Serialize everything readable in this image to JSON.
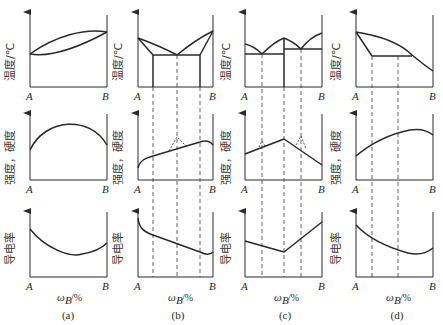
{
  "figure": {
    "colors": {
      "line": "#2a2a2a",
      "background": "#ffffff"
    },
    "row_labels": {
      "temperature": "温度/℃",
      "strength_hardness": "强度，硬度",
      "conductivity": "导电率"
    },
    "axis_labels": {
      "left": "A",
      "right": "B",
      "x_label_main": "ω",
      "x_label_sub": "B",
      "x_label_unit": "/%"
    },
    "panels": [
      {
        "id": "a",
        "caption": "(a)",
        "type": "isomorphous (complete solid solubility)",
        "temperature": "lens-shaped liquidus/solidus from A to B",
        "strength_hardness": "convex arch with maximum near middle",
        "conductivity": "concave curve with minimum near middle-right"
      },
      {
        "id": "b",
        "caption": "(b)",
        "type": "eutectic with limited solid solubility",
        "temperature": "V-shaped liquidus meeting at eutectic point, horizontal eutectic line, solvus lines",
        "strength_hardness": "rising curve with linear middle section and dashed peak at eutectic",
        "conductivity": "descending curve with linear middle section"
      },
      {
        "id": "c",
        "caption": "(c)",
        "type": "intermediate compound with two eutectics",
        "temperature": "two eutectic V's and compound peak, two horizontal eutectic lines",
        "strength_hardness": "piecewise linear peak at compound composition",
        "conductivity": "piecewise linear minimum at compound composition"
      },
      {
        "id": "d",
        "caption": "(d)",
        "type": "peritectic / limited solubility",
        "temperature": "descending liquidus with horizontal line segment",
        "strength_hardness": "convex curve rising then falling near B",
        "conductivity": "concave curve decreasing then rising slightly"
      }
    ]
  }
}
